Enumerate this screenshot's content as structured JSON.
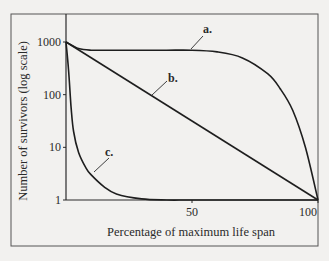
{
  "chart_data": {
    "type": "line",
    "title": "",
    "xlabel": "Percentage of maximum life span",
    "ylabel": "Number of survivors (log scale)",
    "xlim": [
      0,
      100
    ],
    "ylim": [
      1,
      1000
    ],
    "yscale": "log",
    "grid": false,
    "legend": "none (curves labeled directly)",
    "x_ticks": [
      {
        "value": 50,
        "label": "50"
      },
      {
        "value": 100,
        "label": "100"
      }
    ],
    "y_ticks": [
      {
        "value": 1,
        "label": "1"
      },
      {
        "value": 10,
        "label": "10"
      },
      {
        "value": 100,
        "label": "100"
      },
      {
        "value": 1000,
        "label": "1000"
      }
    ],
    "series": [
      {
        "name": "a.",
        "description": "Type I – high survival until late life, then steep decline",
        "x": [
          0,
          5,
          10,
          20,
          30,
          40,
          50,
          60,
          70,
          80,
          85,
          90,
          95,
          100
        ],
        "y": [
          1000,
          750,
          700,
          700,
          700,
          700,
          700,
          650,
          500,
          250,
          130,
          50,
          10,
          1
        ]
      },
      {
        "name": "b.",
        "description": "Type II – constant mortality rate, straight line on log scale",
        "x": [
          0,
          25,
          50,
          75,
          100
        ],
        "y": [
          1000,
          178,
          32,
          5.6,
          1
        ]
      },
      {
        "name": "c.",
        "description": "Type III – very high early mortality, then few survivors persist",
        "x": [
          0,
          1,
          2,
          3,
          5,
          8,
          10,
          15,
          20,
          30,
          40,
          50,
          75,
          100
        ],
        "y": [
          1000,
          300,
          60,
          20,
          8,
          4,
          3,
          1.8,
          1.3,
          1.05,
          1,
          1,
          1,
          1
        ]
      }
    ]
  },
  "labels": {
    "a": "a.",
    "b": "b.",
    "c": "c."
  }
}
